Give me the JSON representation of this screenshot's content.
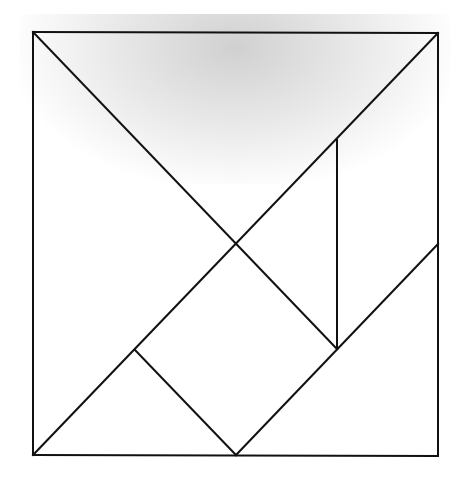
{
  "diagram": {
    "type": "tangram",
    "stroke_color": "#111111",
    "background": "#ffffff",
    "square": {
      "x1": 33,
      "y1": 32,
      "x2": 438,
      "y2": 455
    },
    "segments": [
      {
        "name": "top-edge",
        "x1": 33,
        "y1": 32,
        "x2": 438,
        "y2": 33
      },
      {
        "name": "left-edge",
        "x1": 33,
        "y1": 32,
        "x2": 33,
        "y2": 455
      },
      {
        "name": "right-edge",
        "x1": 438,
        "y1": 33,
        "x2": 438,
        "y2": 455
      },
      {
        "name": "bottom-edge",
        "x1": 33,
        "y1": 455,
        "x2": 438,
        "y2": 456
      },
      {
        "name": "diagonal-top-left",
        "x1": 33,
        "y1": 32,
        "x2": 337,
        "y2": 349
      },
      {
        "name": "diagonal-main",
        "x1": 33,
        "y1": 455,
        "x2": 438,
        "y2": 33
      },
      {
        "name": "vertical-inner",
        "x1": 337,
        "y1": 140,
        "x2": 337,
        "y2": 349
      },
      {
        "name": "small-triangle-edge",
        "x1": 135,
        "y1": 350,
        "x2": 236,
        "y2": 455
      },
      {
        "name": "lower-diagonal",
        "x1": 236,
        "y1": 455,
        "x2": 438,
        "y2": 244
      }
    ]
  }
}
